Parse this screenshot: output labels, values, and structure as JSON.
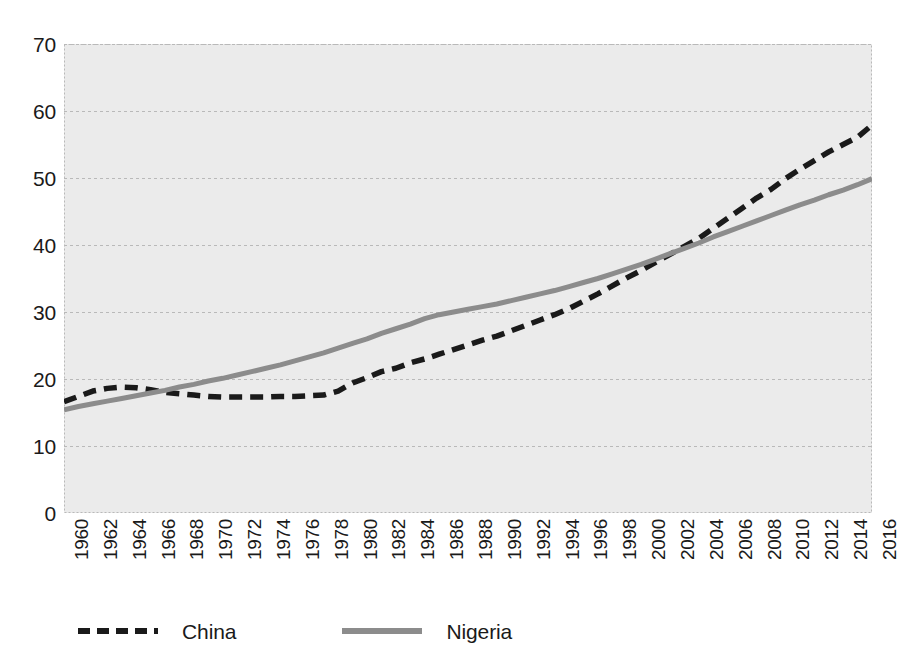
{
  "chart_data": {
    "type": "line",
    "title": "",
    "subtitle": "",
    "xlabel": "",
    "ylabel": "",
    "xlim": [
      1960,
      2016
    ],
    "ylim": [
      0,
      70
    ],
    "ytick_step": 10,
    "ytick_labels": [
      "70",
      "60",
      "50",
      "40",
      "30",
      "20",
      "10",
      "0"
    ],
    "ytick_values": [
      70,
      60,
      50,
      40,
      30,
      20,
      10,
      0
    ],
    "xtick_labels": [
      "1960",
      "1962",
      "1964",
      "1966",
      "1968",
      "1970",
      "1972",
      "1974",
      "1976",
      "1978",
      "1980",
      "1982",
      "1984",
      "1986",
      "1988",
      "1990",
      "1992",
      "1994",
      "1996",
      "1998",
      "2000",
      "2002",
      "2004",
      "2006",
      "2008",
      "2010",
      "2012",
      "2014",
      "2016"
    ],
    "grid": "horizontal-dashed",
    "plot_background": "#ebebeb",
    "legend_position": "bottom",
    "x": [
      1960,
      1961,
      1962,
      1963,
      1964,
      1965,
      1966,
      1967,
      1968,
      1969,
      1970,
      1971,
      1972,
      1973,
      1974,
      1975,
      1976,
      1977,
      1978,
      1979,
      1980,
      1981,
      1982,
      1983,
      1984,
      1985,
      1986,
      1987,
      1988,
      1989,
      1990,
      1991,
      1992,
      1993,
      1994,
      1995,
      1996,
      1997,
      1998,
      1999,
      2000,
      2001,
      2002,
      2003,
      2004,
      2005,
      2006,
      2007,
      2008,
      2009,
      2010,
      2011,
      2012,
      2013,
      2014,
      2015,
      2016
    ],
    "series": [
      {
        "name": "China",
        "color": "#1a1a1a",
        "style": "dashed",
        "values": [
          16.6,
          17.4,
          18.2,
          18.6,
          18.8,
          18.7,
          18.4,
          18.0,
          17.8,
          17.6,
          17.4,
          17.3,
          17.3,
          17.3,
          17.3,
          17.4,
          17.4,
          17.5,
          17.6,
          18.2,
          19.4,
          20.2,
          21.1,
          21.6,
          22.4,
          23.0,
          23.7,
          24.4,
          25.1,
          25.8,
          26.4,
          27.2,
          28.0,
          28.8,
          29.6,
          30.5,
          31.6,
          32.7,
          33.9,
          35.1,
          36.2,
          37.4,
          38.6,
          39.8,
          41.0,
          42.5,
          44.0,
          45.5,
          47.0,
          48.3,
          49.9,
          51.3,
          52.6,
          53.9,
          55.0,
          56.1,
          57.9
        ]
      },
      {
        "name": "Nigeria",
        "color": "#8c8c8c",
        "style": "solid",
        "values": [
          15.4,
          15.9,
          16.3,
          16.7,
          17.1,
          17.5,
          17.9,
          18.3,
          18.8,
          19.2,
          19.7,
          20.1,
          20.6,
          21.1,
          21.6,
          22.1,
          22.7,
          23.3,
          23.9,
          24.6,
          25.3,
          26.0,
          26.8,
          27.5,
          28.2,
          29.0,
          29.6,
          30.0,
          30.4,
          30.8,
          31.2,
          31.7,
          32.2,
          32.7,
          33.2,
          33.8,
          34.4,
          35.0,
          35.7,
          36.4,
          37.1,
          37.9,
          38.7,
          39.5,
          40.3,
          41.2,
          42.0,
          42.8,
          43.6,
          44.4,
          45.2,
          46.0,
          46.7,
          47.5,
          48.2,
          49.0,
          49.9
        ]
      }
    ]
  },
  "legend": {
    "items": [
      {
        "label": "China",
        "swatch": "dashed-black-line"
      },
      {
        "label": "Nigeria",
        "swatch": "solid-gray-line"
      }
    ]
  }
}
